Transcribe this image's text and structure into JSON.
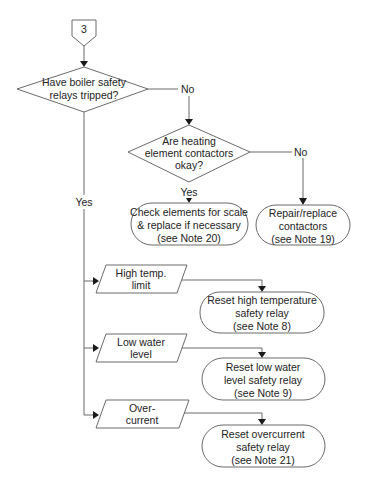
{
  "connector": {
    "label": "3"
  },
  "decisions": [
    {
      "id": "d1",
      "lines": [
        "Have boiler safety",
        "relays tripped?"
      ],
      "no_label": "No",
      "yes_label": "Yes"
    },
    {
      "id": "d2",
      "lines": [
        "Are heating",
        "element contactors",
        "okay?"
      ],
      "no_label": "No",
      "yes_label": "Yes"
    }
  ],
  "actions": [
    {
      "id": "a1",
      "lines": [
        "Check elements for scale",
        "& replace if necessary",
        "(see Note 20)"
      ]
    },
    {
      "id": "a2",
      "lines": [
        "Repair/replace",
        "contactors",
        "(see Note 19)"
      ]
    },
    {
      "id": "a3",
      "lines": [
        "Reset high temperature",
        "safety relay",
        "(see Note 8)"
      ]
    },
    {
      "id": "a4",
      "lines": [
        "Reset low water",
        "level safety relay",
        "(see Note 9)"
      ]
    },
    {
      "id": "a5",
      "lines": [
        "Reset overcurrent",
        "safety relay",
        "(see Note 21)"
      ]
    }
  ],
  "inputs": [
    {
      "id": "i1",
      "lines": [
        "High temp.",
        "limit"
      ]
    },
    {
      "id": "i2",
      "lines": [
        "Low water",
        "level"
      ]
    },
    {
      "id": "i3",
      "lines": [
        "Over-",
        "current"
      ]
    }
  ],
  "colors": {
    "stroke": "#6a6a6a",
    "text": "#222222",
    "arrow": "#1a1a1a",
    "background": "#ffffff"
  }
}
